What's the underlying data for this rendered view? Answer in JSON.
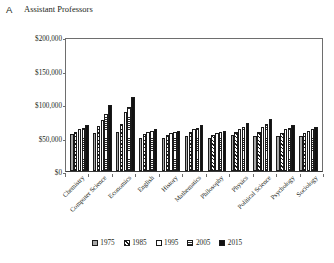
{
  "panel": {
    "label": "A"
  },
  "chart_data": {
    "type": "bar",
    "title": "Assistant Professors",
    "xlabel": "",
    "ylabel": "",
    "ylim": [
      0,
      200000
    ],
    "ytick_labels": [
      "$0",
      "$50,000",
      "$100,000",
      "$150,000",
      "$200,000"
    ],
    "ytick_values": [
      0,
      50000,
      100000,
      150000,
      200000
    ],
    "grid": false,
    "legend_position": "bottom",
    "categories": [
      "Chemistry",
      "Computer Science",
      "Economics",
      "English",
      "History",
      "Mathematics",
      "Philosophy",
      "Physics",
      "Political Science",
      "Psychology",
      "Sociology"
    ],
    "series": [
      {
        "name": "1975",
        "fill": "solid-gray",
        "color": "#a8a8a8",
        "values": [
          55000,
          57000,
          58000,
          50000,
          50000,
          52000,
          50000,
          54000,
          53000,
          52000,
          52000
        ]
      },
      {
        "name": "1985",
        "fill": "diagonal-hatch",
        "color": "#1a1a1a",
        "values": [
          58000,
          67000,
          70000,
          55000,
          54000,
          58000,
          54000,
          58000,
          58000,
          56000,
          56000
        ]
      },
      {
        "name": "1995",
        "fill": "white",
        "color": "#ffffff",
        "values": [
          62000,
          76000,
          88000,
          58000,
          56000,
          62000,
          56000,
          62000,
          66000,
          62000,
          60000
        ]
      },
      {
        "name": "2005",
        "fill": "horizontal-lines",
        "color": "#2b2b2b",
        "values": [
          64000,
          85000,
          96000,
          60000,
          58000,
          64000,
          58000,
          66000,
          70000,
          64000,
          62000
        ]
      },
      {
        "name": "2015",
        "fill": "solid-black",
        "color": "#111111",
        "values": [
          68000,
          98000,
          110000,
          62000,
          60000,
          68000,
          60000,
          72000,
          78000,
          68000,
          66000
        ]
      }
    ]
  }
}
